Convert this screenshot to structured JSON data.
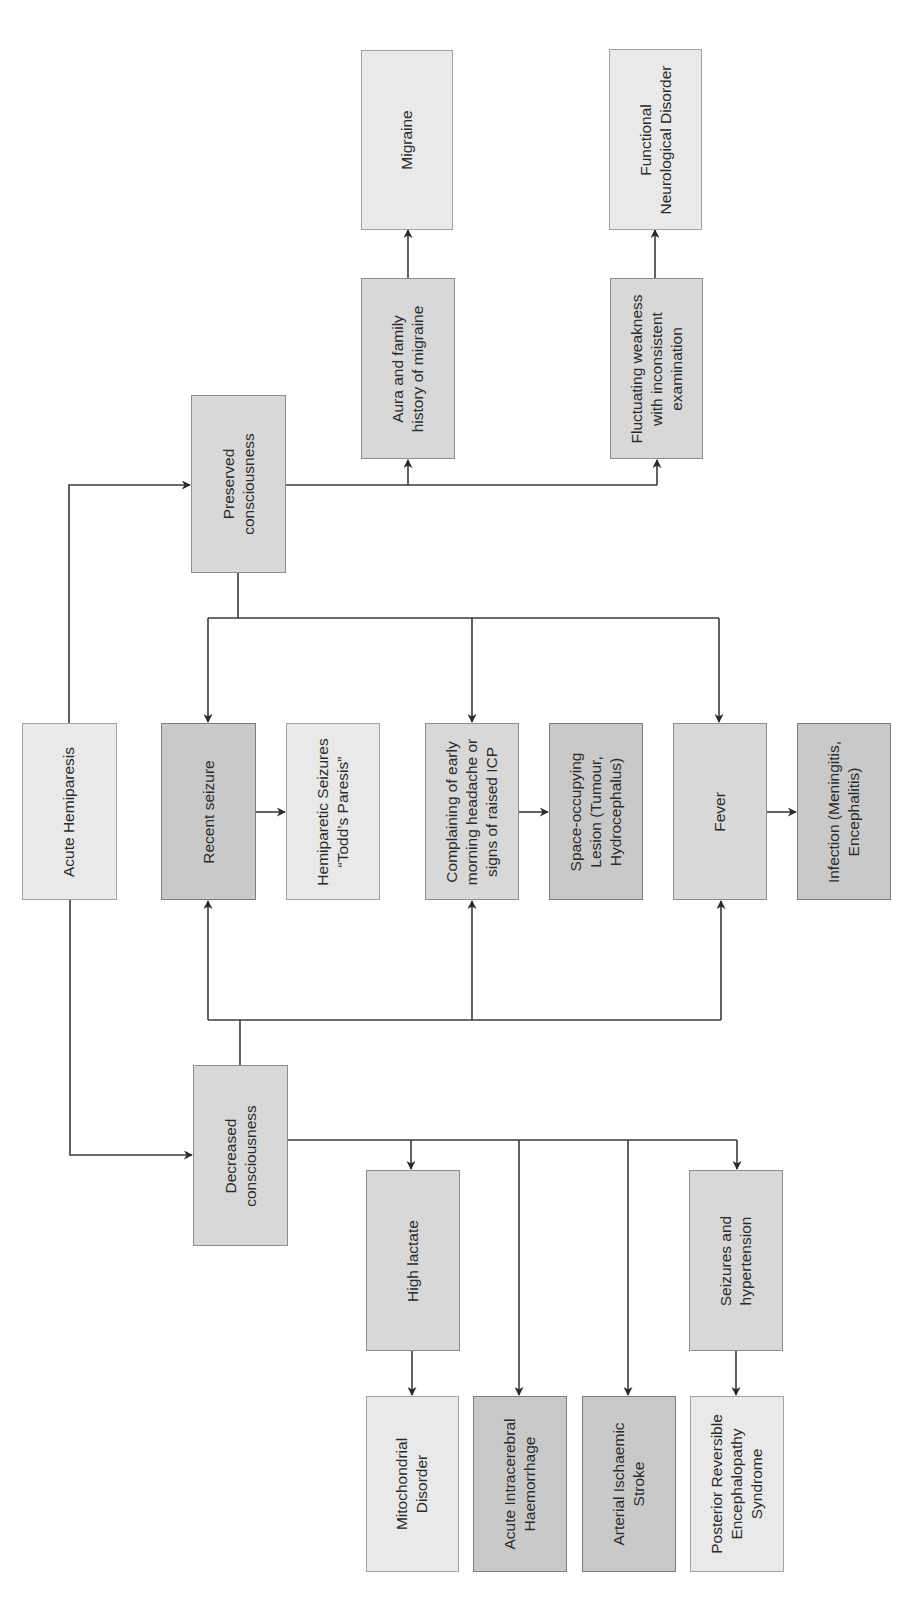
{
  "diagram": {
    "type": "flowchart",
    "orientation": "rotated-90-ccw",
    "colors": {
      "light": "#e9e9e9",
      "medium": "#d8d8d8",
      "dark": "#c9c9c9",
      "line": "#3a3a3a"
    },
    "nodes": {
      "acute_hemiparesis": {
        "label": "Acute Hemiparesis",
        "shade": "light"
      },
      "preserved": {
        "label": "Preserved\nconsciousness",
        "shade": "medium"
      },
      "decreased": {
        "label": "Decreased\nconsciousness",
        "shade": "medium"
      },
      "aura": {
        "label": "Aura and family\nhistory of migraine",
        "shade": "medium"
      },
      "migraine": {
        "label": "Migraine",
        "shade": "light"
      },
      "fluctuating": {
        "label": "Fluctuating weakness\nwith inconsistent\nexamination",
        "shade": "medium"
      },
      "functional": {
        "label": "Functional\nNeurological Disorder",
        "shade": "light"
      },
      "recent_seizure": {
        "label": "Recent seizure",
        "shade": "dark"
      },
      "todds": {
        "label": "Hemiparetic Seizures\n“Todd’s Paresis”",
        "shade": "light"
      },
      "complaining": {
        "label": "Complaining of early\nmorning headache or\nsigns of raised ICP",
        "shade": "medium"
      },
      "space_occupying": {
        "label": "Space-occupying\nLesion (Tumour,\nHydrocephalus)",
        "shade": "dark"
      },
      "fever": {
        "label": "Fever",
        "shade": "medium"
      },
      "infection": {
        "label": "Infection (Meningitis,\nEncephalitis)",
        "shade": "dark"
      },
      "high_lactate": {
        "label": "High lactate",
        "shade": "medium"
      },
      "mitochondrial": {
        "label": "Mitochondrial\nDisorder",
        "shade": "light"
      },
      "ich": {
        "label": "Acute Intracerebral\nHaemorrhage",
        "shade": "dark"
      },
      "ais": {
        "label": "Arterial Ischaemic\nStroke",
        "shade": "dark"
      },
      "seizures_htn": {
        "label": "Seizures and\nhypertension",
        "shade": "medium"
      },
      "pres": {
        "label": "Posterior Reversible\nEncephalopathy\nSyndrome",
        "shade": "light"
      }
    },
    "edges": [
      {
        "from": "Acute Hemiparesis",
        "to": "Preserved consciousness"
      },
      {
        "from": "Acute Hemiparesis",
        "to": "Decreased consciousness"
      },
      {
        "from": "Preserved consciousness",
        "to": "Aura and family history of migraine"
      },
      {
        "from": "Preserved consciousness",
        "to": "Fluctuating weakness with inconsistent examination"
      },
      {
        "from": "Preserved consciousness",
        "to": "Recent seizure"
      },
      {
        "from": "Preserved consciousness",
        "to": "Complaining of early morning headache or signs of raised ICP"
      },
      {
        "from": "Preserved consciousness",
        "to": "Fever"
      },
      {
        "from": "Decreased consciousness",
        "to": "Recent seizure"
      },
      {
        "from": "Decreased consciousness",
        "to": "Complaining of early morning headache or signs of raised ICP"
      },
      {
        "from": "Decreased consciousness",
        "to": "Fever"
      },
      {
        "from": "Decreased consciousness",
        "to": "High lactate"
      },
      {
        "from": "Decreased consciousness",
        "to": "Acute Intracerebral Haemorrhage"
      },
      {
        "from": "Decreased consciousness",
        "to": "Arterial Ischaemic Stroke"
      },
      {
        "from": "Decreased consciousness",
        "to": "Seizures and hypertension"
      },
      {
        "from": "Aura and family history of migraine",
        "to": "Migraine"
      },
      {
        "from": "Fluctuating weakness with inconsistent examination",
        "to": "Functional Neurological Disorder"
      },
      {
        "from": "Recent seizure",
        "to": "Hemiparetic Seizures “Todd’s Paresis”"
      },
      {
        "from": "Complaining of early morning headache or signs of raised ICP",
        "to": "Space-occupying Lesion (Tumour, Hydrocephalus)"
      },
      {
        "from": "Fever",
        "to": "Infection (Meningitis, Encephalitis)"
      },
      {
        "from": "High lactate",
        "to": "Mitochondrial Disorder"
      },
      {
        "from": "Seizures and hypertension",
        "to": "Posterior Reversible Encephalopathy Syndrome"
      }
    ]
  }
}
